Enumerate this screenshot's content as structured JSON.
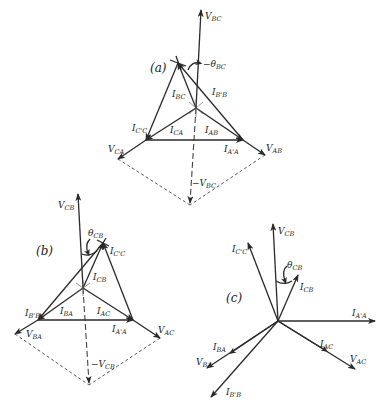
{
  "figure": {
    "panels": [
      {
        "id": "a",
        "label": "(a)",
        "phasors": [
          {
            "name": "V_BC",
            "label": "V",
            "sub": "BC"
          },
          {
            "name": "-V_BC",
            "label": "−V",
            "sub": "BC",
            "style": "dashed"
          },
          {
            "name": "V_CA",
            "label": "V",
            "sub": "CA"
          },
          {
            "name": "V_AB",
            "label": "V",
            "sub": "AB"
          },
          {
            "name": "I_BC",
            "label": "I",
            "sub": "BC"
          },
          {
            "name": "I_CA",
            "label": "I",
            "sub": "CA"
          },
          {
            "name": "I_AB",
            "label": "I",
            "sub": "AB"
          },
          {
            "name": "I_C'C",
            "label": "I",
            "sub": "C'C"
          },
          {
            "name": "I_B'B",
            "label": "I",
            "sub": "B'B"
          },
          {
            "name": "I_A'A",
            "label": "I",
            "sub": "A'A"
          }
        ],
        "angle": {
          "label": "−θ",
          "sub": "BC"
        }
      },
      {
        "id": "b",
        "label": "(b)",
        "phasors": [
          {
            "name": "V_CB",
            "label": "V",
            "sub": "CB"
          },
          {
            "name": "-V_CB",
            "label": "−V",
            "sub": "CB",
            "style": "dashed"
          },
          {
            "name": "V_BA",
            "label": "V",
            "sub": "BA"
          },
          {
            "name": "V_AC",
            "label": "V",
            "sub": "AC"
          },
          {
            "name": "I_CB",
            "label": "I",
            "sub": "CB"
          },
          {
            "name": "I_BA",
            "label": "I",
            "sub": "BA"
          },
          {
            "name": "I_AC",
            "label": "I",
            "sub": "AC"
          },
          {
            "name": "I_C'C",
            "label": "I",
            "sub": "C'C"
          },
          {
            "name": "I_B'B",
            "label": "I",
            "sub": "B'B"
          },
          {
            "name": "I_A'A",
            "label": "I",
            "sub": "A'A"
          }
        ],
        "angle": {
          "label": "θ",
          "sub": "CB"
        }
      },
      {
        "id": "c",
        "label": "(c)",
        "phasors": [
          {
            "name": "V_CB",
            "label": "V",
            "sub": "CB"
          },
          {
            "name": "I_C'C",
            "label": "I",
            "sub": "C'C"
          },
          {
            "name": "I_CB",
            "label": "I",
            "sub": "CB"
          },
          {
            "name": "I_A'A",
            "label": "I",
            "sub": "A'A"
          },
          {
            "name": "I_AC",
            "label": "I",
            "sub": "AC"
          },
          {
            "name": "V_AC",
            "label": "V",
            "sub": "AC"
          },
          {
            "name": "I_BA",
            "label": "I",
            "sub": "BA"
          },
          {
            "name": "V_BA",
            "label": "V",
            "sub": "BA"
          },
          {
            "name": "I_B'B",
            "label": "I",
            "sub": "B'B"
          }
        ],
        "angle": {
          "label": "θ",
          "sub": "CB"
        }
      }
    ]
  }
}
